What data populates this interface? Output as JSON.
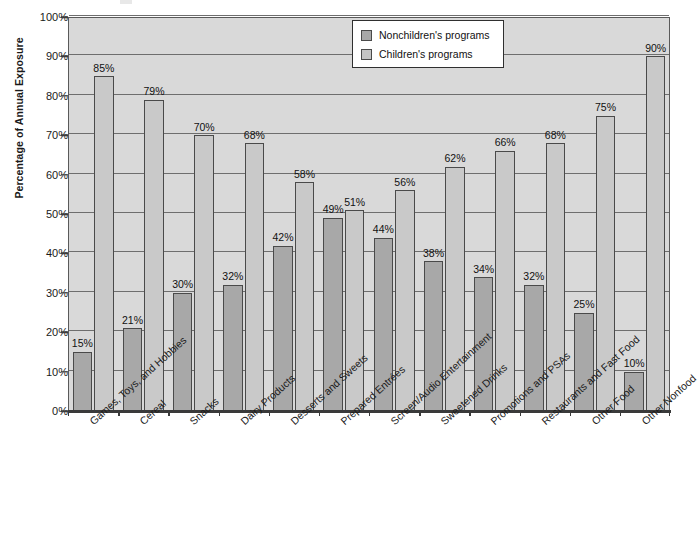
{
  "chart_data": {
    "type": "bar",
    "title": "",
    "subtitle": "",
    "xlabel": "",
    "ylabel": "Percentage of Annual Exposure",
    "ylim": [
      0,
      100
    ],
    "y_tick_labels": [
      "0%",
      "10%",
      "20%",
      "30%",
      "40%",
      "50%",
      "60%",
      "70%",
      "80%",
      "90%",
      "100%"
    ],
    "y_ticks": [
      0,
      10,
      20,
      30,
      40,
      50,
      60,
      70,
      80,
      90,
      100
    ],
    "grid": true,
    "legend_position": "top-center-right",
    "value_suffix": "%",
    "categories": [
      "Games, Toys, and Hobbies",
      "Cereal",
      "Snacks",
      "Dairy Products",
      "Desserts and Sweets",
      "Prepared Entrées",
      "Screen/Audio Entertainment",
      "Sweetened Drinks",
      "Promotions and PSAs",
      "Restaurants and Fast Food",
      "Other Food",
      "Other Nonfood"
    ],
    "series": [
      {
        "name": "Nonchildren's programs",
        "color": "#a8a8a8",
        "values": [
          15,
          21,
          30,
          32,
          42,
          49,
          44,
          38,
          34,
          32,
          25,
          10
        ],
        "labels": [
          "15%",
          "21%",
          "30%",
          "32%",
          "42%",
          "49%",
          "44%",
          "38%",
          "34%",
          "32%",
          "25%",
          "10%"
        ]
      },
      {
        "name": "Children's programs",
        "color": "#c9c9c9",
        "values": [
          85,
          79,
          70,
          68,
          58,
          51,
          56,
          62,
          66,
          68,
          75,
          90
        ],
        "labels": [
          "85%",
          "79%",
          "70%",
          "68%",
          "58%",
          "51%",
          "56%",
          "62%",
          "66%",
          "68%",
          "75%",
          "90%"
        ]
      }
    ]
  },
  "legend": {
    "items": [
      {
        "label": "Nonchildren's programs",
        "swatch": "nonchild"
      },
      {
        "label": "Children's programs",
        "swatch": "child"
      }
    ]
  }
}
